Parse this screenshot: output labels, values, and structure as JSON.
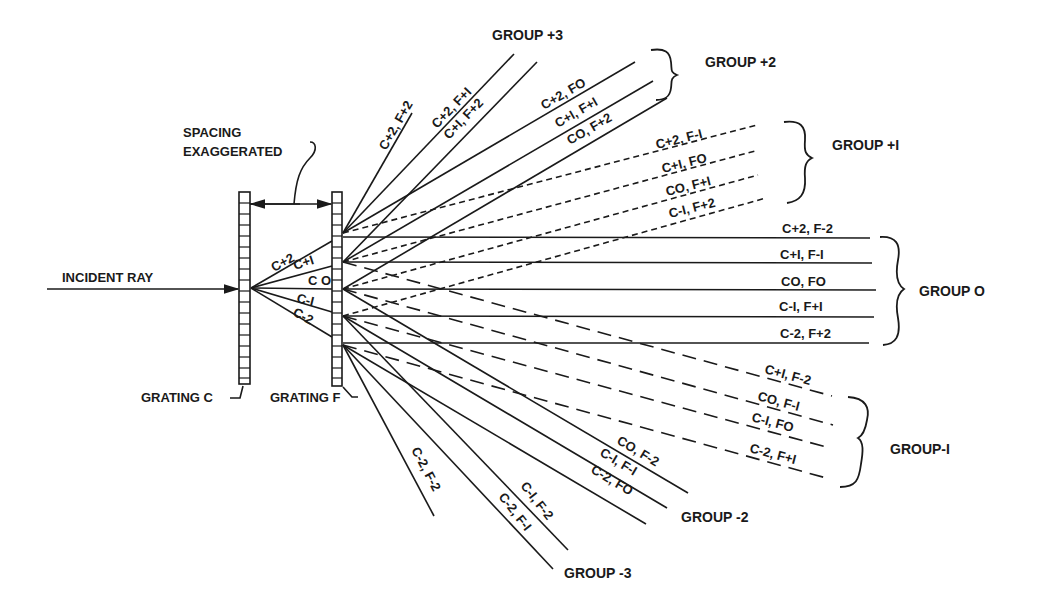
{
  "labels": {
    "incident_ray": "INCIDENT RAY",
    "spacing_line1": "SPACING",
    "spacing_line2": "EXAGGERATED",
    "grating_c": "GRATING C",
    "grating_f": "GRATING F"
  },
  "c_orders": [
    "C+2",
    "C+I",
    "C O",
    "C-I",
    "C-2"
  ],
  "groups": {
    "plus3": {
      "label": "GROUP +3",
      "rays": [
        "C+2, F+2",
        "C+2, F+I",
        "C+I, F+2"
      ]
    },
    "plus2": {
      "label": "GROUP +2",
      "rays": [
        "C+2, FO",
        "C+I, F+I",
        "CO, F+2"
      ]
    },
    "plus1": {
      "label": "GROUP +I",
      "rays": [
        "C+2, F-I",
        "C+I, FO",
        "CO, F+I",
        "C-I, F+2"
      ]
    },
    "zero": {
      "label": "GROUP O",
      "rays": [
        "C+2, F-2",
        "C+I, F-I",
        "CO, FO",
        "C-I, F+I",
        "C-2, F+2"
      ]
    },
    "minus1": {
      "label": "GROUP-I",
      "rays": [
        "C+I, F-2",
        "CO, F-I",
        "C-I, FO",
        "C-2, F+I"
      ]
    },
    "minus2": {
      "label": "GROUP -2",
      "rays": [
        "CO, F-2",
        "C-I, F-I",
        "C-2, FO"
      ]
    },
    "minus3": {
      "label": "GROUP -3",
      "rays": [
        "C-2, F-2",
        "C-I, F-2",
        "C-2, F-I"
      ]
    }
  }
}
